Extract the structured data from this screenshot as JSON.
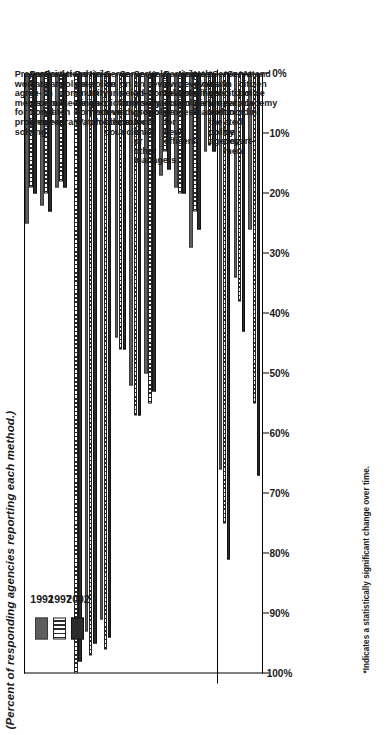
{
  "title": "(Percent of responding agencies reporting each method.)",
  "footnote": "*Indicates a statistically significant change over time.",
  "legend": {
    "items": [
      {
        "label": "1992",
        "color": "#5d5d5d",
        "style": "solid-gray"
      },
      {
        "label": "1997",
        "color": "#ffffff",
        "style": "vertical-striped"
      },
      {
        "label": "2002",
        "color": "#2b2b2b",
        "style": "solid-dark"
      }
    ]
  },
  "axis": {
    "ticks": [
      "0%",
      "10%",
      "20%",
      "30%",
      "40%",
      "50%",
      "60%",
      "70%",
      "80%",
      "90%",
      "100%"
    ],
    "min": 0,
    "max": 100
  },
  "chart_data": {
    "type": "bar",
    "title": "(Percent of responding agencies reporting each method.)",
    "xlabel": "",
    "ylabel": "Percent of responding agencies",
    "ylim": [
      0,
      100
    ],
    "grid": false,
    "orientation": "vertical-bars-rotated",
    "legend_position": "top-left",
    "categories": [
      "Prepare work agree- ments for problem solving",
      "Partici- pate in promo- tional process",
      "Partici- pate in court watch program",
      "Attend police- community meetings",
      "Partici- pate in Neigh- borhood Watch",
      "Help police ID and resolve problems",
      "Serve on juris- diction- level advisory councils",
      "Serve on neigh- borhood advisory councils",
      "Serve on ad- visory group for chief or other managers",
      "Help review complaints against police",
      "Participate in sel- ection process for new officers",
      "Help develop policing policies",
      "Help evaluate officers' perfor- mance",
      "*Serve as vol- unteer within the police agency",
      "*Serve in citizen patrols coordin- ated by depart- ment",
      "*Attend citizen police academy"
    ],
    "series": [
      {
        "name": "1992",
        "values": [
          25,
          22,
          19,
          0,
          93,
          91,
          44,
          52,
          50,
          17,
          19,
          29,
          13,
          66,
          34,
          26
        ]
      },
      {
        "name": "1997",
        "values": [
          19,
          20,
          18,
          100,
          97,
          96,
          46,
          57,
          55,
          13,
          20,
          23,
          12,
          75,
          38,
          55
        ]
      },
      {
        "name": "2002",
        "values": [
          20,
          23,
          19,
          98,
          95,
          94,
          46,
          57,
          53,
          16,
          20,
          26,
          13,
          81,
          43,
          67
        ]
      }
    ]
  }
}
